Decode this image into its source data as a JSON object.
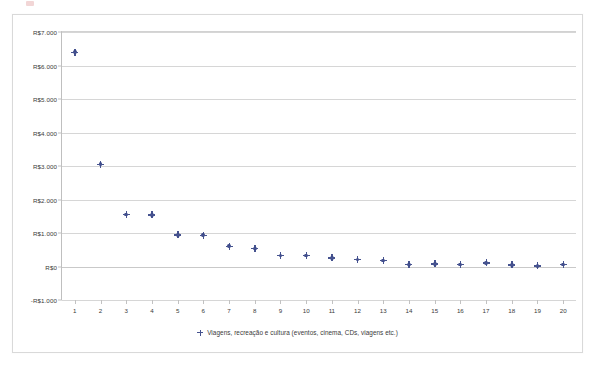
{
  "artifact": {
    "name": "page-corner-mark",
    "color": "#e8b5b5"
  },
  "legend": {
    "position": "bottom-center",
    "marker_icon": "cross-marker-icon",
    "label": "Viagens, recreação e cultura (eventos, cinema, CDs, viagens etc.)"
  },
  "colors": {
    "marker": "#3c4a8a",
    "gridline": "#d6d6d6",
    "axis": "#bfbfbf",
    "text": "#3a3a3a",
    "frame": "#d9d9d9",
    "background": "#ffffff"
  },
  "chart_data": {
    "type": "scatter",
    "title": "",
    "subtitle": "",
    "xlabel": "",
    "ylabel": "",
    "grid": true,
    "legend_position": "bottom",
    "x": [
      1,
      2,
      3,
      4,
      5,
      6,
      7,
      8,
      9,
      10,
      11,
      12,
      13,
      14,
      15,
      16,
      17,
      18,
      19,
      20
    ],
    "categories": [
      "1",
      "2",
      "3",
      "4",
      "5",
      "6",
      "7",
      "8",
      "9",
      "10",
      "11",
      "12",
      "13",
      "14",
      "15",
      "16",
      "17",
      "18",
      "19",
      "20"
    ],
    "xtick_labels": [
      "1",
      "2",
      "3",
      "4",
      "5",
      "6",
      "7",
      "8",
      "9",
      "10",
      "11",
      "12",
      "13",
      "14",
      "15",
      "16",
      "17",
      "18",
      "19",
      "20"
    ],
    "ytick_labels": [
      "R$7.000",
      "R$6.000",
      "R$5.000",
      "R$4.000",
      "R$3.000",
      "R$2.000",
      "R$1.000",
      "R$0",
      "-R$1.000"
    ],
    "ytick_values": [
      7000,
      6000,
      5000,
      4000,
      3000,
      2000,
      1000,
      0,
      -1000
    ],
    "ylim": [
      -1000,
      7000
    ],
    "xlim": [
      0.5,
      20.5
    ],
    "series": [
      {
        "name": "Viagens, recreação e cultura (eventos, cinema, CDs, viagens etc.)",
        "color": "#3c4a8a",
        "values": [
          6400,
          3050,
          1550,
          1540,
          950,
          940,
          600,
          540,
          330,
          330,
          260,
          210,
          180,
          60,
          80,
          60,
          110,
          50,
          20,
          60
        ]
      }
    ]
  }
}
